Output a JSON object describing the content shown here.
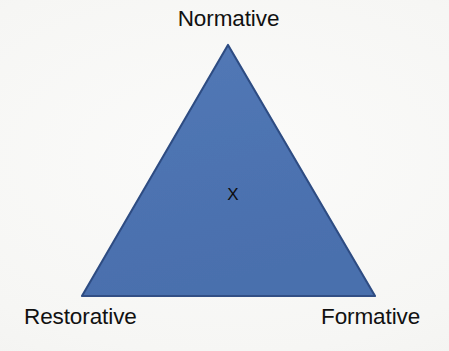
{
  "diagram": {
    "type": "triangle-model",
    "shape_name": "equilateral-triangle",
    "background_color": "#f8f8f6",
    "fill_color": "#4e74b2",
    "edge_color": "#2e4a7d",
    "label_color": "#111111",
    "vertices": [
      {
        "id": "apex",
        "label": "Normative",
        "x": 228,
        "y": 45
      },
      {
        "id": "bottom-left",
        "label": "Restorative",
        "x": 82,
        "y": 296
      },
      {
        "id": "bottom-right",
        "label": "Formative",
        "x": 375,
        "y": 296
      }
    ],
    "labels": {
      "top": "Normative",
      "bottom_left": "Restorative",
      "bottom_right": "Formative"
    },
    "marker": {
      "symbol": "X",
      "name": "position-marker",
      "x": 232,
      "y": 196,
      "color": "#0d0d0d"
    }
  }
}
